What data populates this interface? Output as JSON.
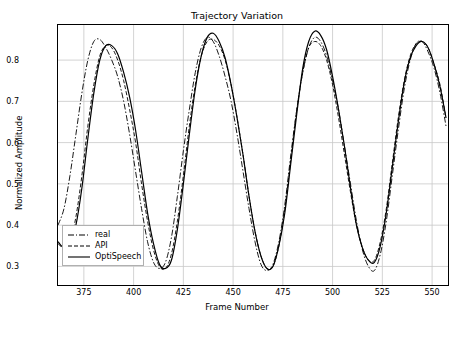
{
  "chart_data": {
    "type": "line",
    "title": "Trajectory Variation",
    "xlabel": "Frame Number",
    "ylabel": "Normalized Amplitude",
    "xlim": [
      362,
      558
    ],
    "ylim": [
      0.255,
      0.885
    ],
    "xticks": [
      375,
      400,
      425,
      450,
      475,
      500,
      525,
      550
    ],
    "yticks": [
      0.3,
      0.4,
      0.5,
      0.6,
      0.7,
      0.8
    ],
    "grid": true,
    "legend_position": "lower left",
    "series": [
      {
        "name": "real",
        "style": "dashdot",
        "color": "#000000",
        "x": [
          362,
          365,
          368,
          371,
          374,
          377,
          380,
          383,
          386,
          389,
          392,
          395,
          398,
          401,
          404,
          407,
          410,
          413,
          416,
          419,
          422,
          425,
          428,
          431,
          434,
          437,
          440,
          443,
          446,
          449,
          452,
          455,
          458,
          461,
          464,
          467,
          470,
          473,
          476,
          479,
          482,
          485,
          488,
          491,
          494,
          497,
          500,
          503,
          506,
          509,
          512,
          515,
          518,
          521,
          524,
          527,
          530,
          533,
          536,
          539,
          542,
          545,
          548,
          551,
          554,
          557
        ],
        "y": [
          0.4,
          0.44,
          0.52,
          0.62,
          0.72,
          0.8,
          0.845,
          0.85,
          0.83,
          0.8,
          0.76,
          0.7,
          0.62,
          0.53,
          0.44,
          0.36,
          0.31,
          0.295,
          0.31,
          0.37,
          0.47,
          0.58,
          0.68,
          0.77,
          0.83,
          0.855,
          0.845,
          0.81,
          0.76,
          0.7,
          0.62,
          0.53,
          0.44,
          0.36,
          0.305,
          0.29,
          0.305,
          0.36,
          0.45,
          0.57,
          0.68,
          0.77,
          0.83,
          0.855,
          0.845,
          0.81,
          0.75,
          0.68,
          0.59,
          0.5,
          0.41,
          0.34,
          0.3,
          0.29,
          0.33,
          0.41,
          0.52,
          0.63,
          0.73,
          0.8,
          0.84,
          0.845,
          0.82,
          0.78,
          0.72,
          0.64
        ]
      },
      {
        "name": "API",
        "style": "dashed",
        "color": "#000000",
        "x": [
          362,
          365,
          368,
          371,
          374,
          377,
          380,
          383,
          386,
          389,
          392,
          395,
          398,
          401,
          404,
          407,
          410,
          413,
          416,
          419,
          422,
          425,
          428,
          431,
          434,
          437,
          440,
          443,
          446,
          449,
          452,
          455,
          458,
          461,
          464,
          467,
          470,
          473,
          476,
          479,
          482,
          485,
          488,
          491,
          494,
          497,
          500,
          503,
          506,
          509,
          512,
          515,
          518,
          521,
          524,
          527,
          530,
          533,
          536,
          539,
          542,
          545,
          548,
          551,
          554,
          557
        ],
        "y": [
          0.355,
          0.345,
          0.36,
          0.42,
          0.52,
          0.64,
          0.74,
          0.81,
          0.835,
          0.83,
          0.8,
          0.75,
          0.68,
          0.6,
          0.5,
          0.41,
          0.34,
          0.3,
          0.295,
          0.33,
          0.41,
          0.52,
          0.64,
          0.74,
          0.81,
          0.845,
          0.85,
          0.835,
          0.8,
          0.74,
          0.66,
          0.57,
          0.47,
          0.385,
          0.325,
          0.295,
          0.3,
          0.35,
          0.44,
          0.56,
          0.68,
          0.77,
          0.83,
          0.845,
          0.835,
          0.8,
          0.74,
          0.66,
          0.57,
          0.48,
          0.4,
          0.345,
          0.315,
          0.315,
          0.36,
          0.44,
          0.55,
          0.66,
          0.75,
          0.81,
          0.84,
          0.845,
          0.83,
          0.79,
          0.74,
          0.66
        ]
      },
      {
        "name": "OptiSpeech",
        "style": "solid",
        "color": "#000000",
        "x": [
          362,
          365,
          368,
          371,
          374,
          377,
          380,
          383,
          386,
          389,
          392,
          395,
          398,
          401,
          404,
          407,
          410,
          413,
          416,
          419,
          422,
          425,
          428,
          431,
          434,
          437,
          440,
          443,
          446,
          449,
          452,
          455,
          458,
          461,
          464,
          467,
          470,
          473,
          476,
          479,
          482,
          485,
          488,
          491,
          494,
          497,
          500,
          503,
          506,
          509,
          512,
          515,
          518,
          521,
          524,
          527,
          530,
          533,
          536,
          539,
          542,
          545,
          548,
          551,
          554,
          557
        ],
        "y": [
          0.36,
          0.345,
          0.355,
          0.4,
          0.49,
          0.61,
          0.72,
          0.8,
          0.835,
          0.835,
          0.815,
          0.77,
          0.71,
          0.63,
          0.53,
          0.43,
          0.355,
          0.305,
          0.295,
          0.315,
          0.39,
          0.5,
          0.62,
          0.73,
          0.81,
          0.855,
          0.865,
          0.845,
          0.805,
          0.74,
          0.66,
          0.57,
          0.47,
          0.385,
          0.325,
          0.295,
          0.3,
          0.35,
          0.43,
          0.55,
          0.67,
          0.78,
          0.845,
          0.87,
          0.86,
          0.825,
          0.76,
          0.68,
          0.59,
          0.49,
          0.4,
          0.345,
          0.315,
          0.31,
          0.35,
          0.43,
          0.54,
          0.65,
          0.745,
          0.805,
          0.835,
          0.845,
          0.83,
          0.79,
          0.735,
          0.66
        ]
      }
    ]
  },
  "legend": {
    "items": [
      {
        "label": "real"
      },
      {
        "label": "API"
      },
      {
        "label": "OptiSpeech"
      }
    ]
  }
}
